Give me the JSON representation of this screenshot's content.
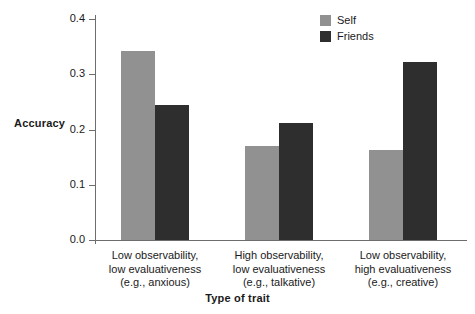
{
  "chart_data": {
    "type": "bar",
    "title": "",
    "xlabel": "Type of trait",
    "ylabel": "Accuracy",
    "categories": [
      [
        "Low observability,",
        "low evaluativeness",
        "(e.g., anxious)"
      ],
      [
        "High observability,",
        "low evaluativeness",
        "(e.g., talkative)"
      ],
      [
        "Low observability,",
        "high evaluativeness",
        "(e.g., creative)"
      ]
    ],
    "series": [
      {
        "name": "Self",
        "color": "#919191",
        "values": [
          0.343,
          0.171,
          0.163
        ]
      },
      {
        "name": "Friends",
        "color": "#2e2e2e",
        "values": [
          0.245,
          0.212,
          0.322
        ]
      }
    ],
    "ylim": [
      0.0,
      0.4
    ],
    "yticks": [
      "0.0",
      "0.1",
      "0.2",
      "0.3",
      "0.4"
    ],
    "ytick_values": [
      0.0,
      0.1,
      0.2,
      0.3,
      0.4
    ],
    "grid": false,
    "legend_position": "top-right"
  }
}
